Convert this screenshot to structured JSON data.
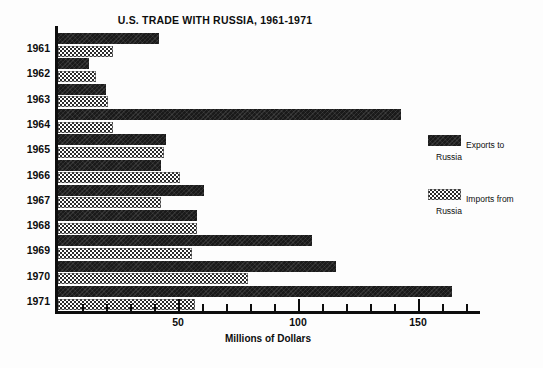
{
  "chart_data": {
    "type": "bar",
    "orientation": "horizontal",
    "title": "U.S. TRADE WITH RUSSIA, 1961-1971",
    "xlabel": "Millions of Dollars",
    "ylabel": "",
    "xlim": [
      0,
      175
    ],
    "xticks_major": [
      50,
      100,
      150
    ],
    "xtick_labels": [
      "50",
      "100",
      "150"
    ],
    "xticks_minor": [
      10,
      20,
      30,
      40,
      60,
      70,
      80,
      90,
      110,
      120,
      130,
      140,
      160,
      170
    ],
    "grid": false,
    "legend_position": "right",
    "categories": [
      "1961",
      "1962",
      "1963",
      "1964",
      "1965",
      "1966",
      "1967",
      "1968",
      "1969",
      "1970",
      "1971"
    ],
    "series": [
      {
        "name": "Exports to Russia",
        "legend_line1": "Exports to",
        "legend_line2": "Russia",
        "pattern": "solid-dark",
        "color": "#1a1a1a",
        "values": [
          42,
          13,
          20,
          143,
          45,
          43,
          61,
          58,
          106,
          116,
          164
        ]
      },
      {
        "name": "Imports from Russia",
        "legend_line1": "Imports from",
        "legend_line2": "Russia",
        "pattern": "checkered",
        "color": "#2b2b2b",
        "values": [
          23,
          16,
          21,
          23,
          44,
          51,
          43,
          58,
          56,
          79,
          57
        ]
      }
    ]
  }
}
